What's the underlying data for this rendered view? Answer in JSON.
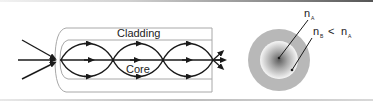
{
  "figure": {
    "fiber_side_view": {
      "cladding_label": "Cladding",
      "core_label": "Core"
    },
    "cross_section": {
      "core_index_label": "n",
      "core_index_sub": "A",
      "cladding_index_label": "n",
      "cladding_index_sub": "B",
      "relation_symbol": "<",
      "relation_rhs": "n",
      "relation_rhs_sub": "A"
    },
    "colors": {
      "ray": "#1a1a1a",
      "fiber_outline": "#a8a8a8",
      "cladding_fill": "#b5b5b5",
      "core_center": "#6e6e6e",
      "core_edge": "#f4f4f4"
    }
  }
}
